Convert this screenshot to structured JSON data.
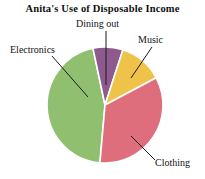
{
  "chart_data": {
    "type": "pie",
    "title": "Anita's Use of Disposable Income",
    "subtitle": "",
    "xlabel": "",
    "ylabel": "",
    "legend_position": "none",
    "labels_position": "outside-with-leader-lines",
    "grid": false,
    "categories": [
      "Dining out",
      "Music",
      "Clothing",
      "Electronics"
    ],
    "values": [
      8,
      12,
      45,
      35
    ],
    "units": "percent",
    "slices": [
      {
        "label": "Dining out",
        "value": 8,
        "color": "#8E5A8E",
        "start_angle_deg": 348,
        "end_angle_deg": 18
      },
      {
        "label": "Music",
        "value": 12,
        "color": "#EFC24A",
        "start_angle_deg": 18,
        "end_angle_deg": 62
      },
      {
        "label": "Clothing",
        "value": 45,
        "color": "#DF6E7C",
        "start_angle_deg": 62,
        "end_angle_deg": 185
      },
      {
        "label": "Electronics",
        "value": 35,
        "color": "#8FBF6F",
        "start_angle_deg": 185,
        "end_angle_deg": 348
      }
    ]
  },
  "title": {
    "text": "Anita's Use of Disposable Income"
  },
  "labels": {
    "dining_out": "Dining out",
    "music": "Music",
    "electronics": "Electronics",
    "clothing": "Clothing"
  },
  "colors": {
    "background": "#FFFFFF",
    "text": "#121212",
    "leader_line": "#1b1b1b",
    "slice_gap": "#FFFFFF",
    "dining_out": "#8E5A8E",
    "music": "#EFC24A",
    "clothing": "#DF6E7C",
    "electronics": "#8FBF6F"
  }
}
